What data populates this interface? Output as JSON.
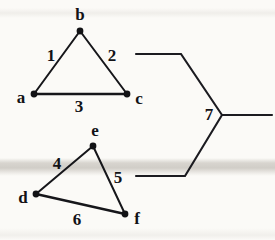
{
  "figure": {
    "background_color": "#fbfaf7",
    "ink_color": "#16161a"
  },
  "graphs": [
    {
      "id": "top-triangle",
      "vertices": [
        {
          "label": "b",
          "x": 80,
          "y": 31,
          "label_x": 80,
          "label_y": 14
        },
        {
          "label": "a",
          "x": 34,
          "y": 94,
          "label_x": 21,
          "label_y": 97
        },
        {
          "label": "c",
          "x": 127,
          "y": 94,
          "label_x": 139,
          "label_y": 98
        }
      ],
      "edges": [
        {
          "label": "1",
          "from": "a",
          "to": "b",
          "x1": 34,
          "y1": 94,
          "x2": 80,
          "y2": 31,
          "width": 2.0,
          "label_x": 51,
          "label_y": 55
        },
        {
          "label": "2",
          "from": "b",
          "to": "c",
          "x1": 80,
          "y1": 31,
          "x2": 127,
          "y2": 94,
          "width": 2.0,
          "label_x": 112,
          "label_y": 55
        },
        {
          "label": "3",
          "from": "a",
          "to": "c",
          "x1": 34,
          "y1": 94,
          "x2": 127,
          "y2": 94,
          "width": 2.6,
          "label_x": 79,
          "label_y": 106
        }
      ]
    },
    {
      "id": "bottom-triangle",
      "vertices": [
        {
          "label": "e",
          "x": 93,
          "y": 146,
          "label_x": 95,
          "label_y": 130
        },
        {
          "label": "d",
          "x": 36,
          "y": 194,
          "label_x": 23,
          "label_y": 197
        },
        {
          "label": "f",
          "x": 125,
          "y": 214,
          "label_x": 137,
          "label_y": 218
        }
      ],
      "edges": [
        {
          "label": "4",
          "from": "d",
          "to": "e",
          "x1": 36,
          "y1": 194,
          "x2": 93,
          "y2": 146,
          "width": 2.0,
          "label_x": 57,
          "label_y": 163
        },
        {
          "label": "5",
          "from": "e",
          "to": "f",
          "x1": 93,
          "y1": 146,
          "x2": 125,
          "y2": 214,
          "width": 2.0,
          "label_x": 118,
          "label_y": 177
        },
        {
          "label": "6",
          "from": "d",
          "to": "f",
          "x1": 36,
          "y1": 194,
          "x2": 125,
          "y2": 214,
          "width": 2.4,
          "label_x": 77,
          "label_y": 219
        }
      ]
    }
  ],
  "merge": {
    "label": "7",
    "label_x": 209,
    "label_y": 114,
    "junction_x": 222,
    "junction_y": 115,
    "upper_branch_path": "M 136 54 L 181 54 L 222 115",
    "lower_branch_path": "M 136 176 L 185 176 L 222 115",
    "output_path": "M 222 115 L 272 115"
  }
}
